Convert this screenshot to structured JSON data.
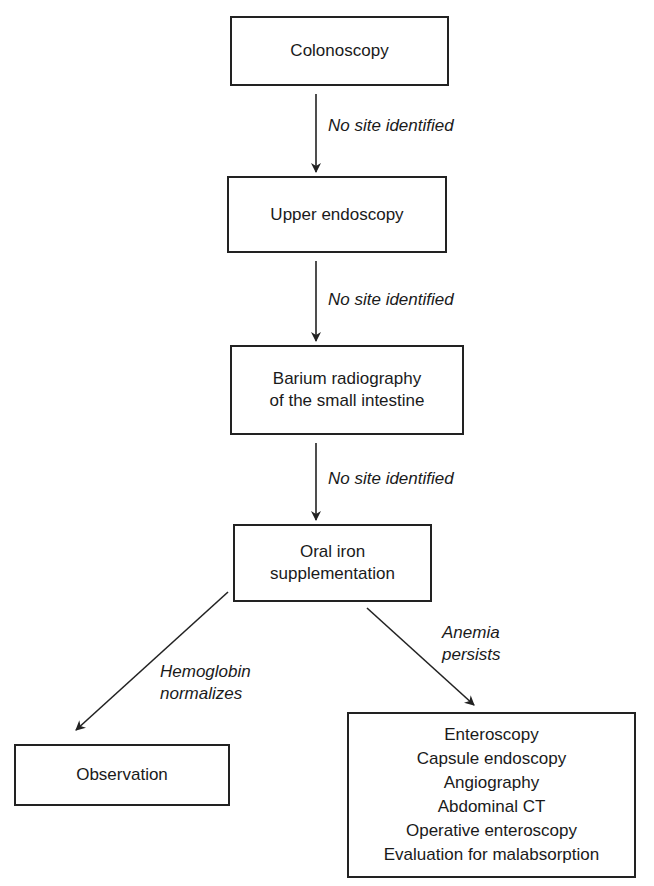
{
  "diagram": {
    "type": "flowchart",
    "nodes": [
      {
        "id": "colonoscopy",
        "lines": [
          "Colonoscopy"
        ]
      },
      {
        "id": "upper_endoscopy",
        "lines": [
          "Upper endoscopy"
        ]
      },
      {
        "id": "barium",
        "lines": [
          "Barium radiography",
          "of the small intestine"
        ]
      },
      {
        "id": "oral_iron",
        "lines": [
          "Oral iron",
          "supplementation"
        ]
      },
      {
        "id": "observation",
        "lines": [
          "Observation"
        ]
      },
      {
        "id": "further_workup",
        "lines": [
          "Enteroscopy",
          "Capsule endoscopy",
          "Angiography",
          "Abdominal CT",
          "Operative enteroscopy",
          "Evaluation for malabsorption"
        ]
      }
    ],
    "edges": [
      {
        "from": "colonoscopy",
        "to": "upper_endoscopy",
        "label": [
          "No site identified"
        ]
      },
      {
        "from": "upper_endoscopy",
        "to": "barium",
        "label": [
          "No site identified"
        ]
      },
      {
        "from": "barium",
        "to": "oral_iron",
        "label": [
          "No site identified"
        ]
      },
      {
        "from": "oral_iron",
        "to": "observation",
        "label": [
          "Hemoglobin",
          "normalizes"
        ]
      },
      {
        "from": "oral_iron",
        "to": "further_workup",
        "label": [
          "Anemia",
          "persists"
        ]
      }
    ]
  },
  "colors": {
    "stroke": "#222222",
    "text": "#1a1a1a",
    "background": "#ffffff"
  }
}
